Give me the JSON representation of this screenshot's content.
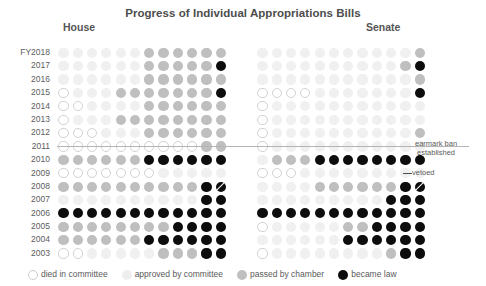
{
  "chart_data": {
    "type": "heatmap",
    "title": "Progress of Individual Appropriations Bills",
    "xlabel": "",
    "ylabel": "",
    "grid": false,
    "legend_position": "bottom-left",
    "panels": [
      {
        "key": "house",
        "label": "House"
      },
      {
        "key": "senate",
        "label": "Senate"
      }
    ],
    "columns": 12,
    "categories": [
      "FY2018",
      "2017",
      "2016",
      "2015",
      "2014",
      "2013",
      "2012",
      "2011",
      "2010",
      "2009",
      "2008",
      "2007",
      "2006",
      "2005",
      "2004",
      "2003"
    ],
    "states": [
      {
        "key": "died",
        "label": "died in committee",
        "color": "#ffffff"
      },
      {
        "key": "approved",
        "label": "approved by committee",
        "color": "#f0f0f0"
      },
      {
        "key": "passed",
        "label": "passed by chamber",
        "color": "#bfbfbf"
      },
      {
        "key": "law",
        "label": "became law",
        "color": "#0d0d0d"
      }
    ],
    "series": [
      {
        "name": "House",
        "rows": [
          {
            "year": "FY2018",
            "cells": [
              "approved",
              "approved",
              "approved",
              "approved",
              "approved",
              "approved",
              "passed",
              "passed",
              "passed",
              "passed",
              "passed",
              "passed"
            ]
          },
          {
            "year": "2017",
            "cells": [
              "approved",
              "approved",
              "approved",
              "approved",
              "approved",
              "approved",
              "passed",
              "passed",
              "passed",
              "passed",
              "passed",
              "law"
            ]
          },
          {
            "year": "2016",
            "cells": [
              "approved",
              "approved",
              "approved",
              "approved",
              "approved",
              "approved",
              "passed",
              "passed",
              "passed",
              "passed",
              "passed",
              "passed"
            ]
          },
          {
            "year": "2015",
            "cells": [
              "died",
              "approved",
              "approved",
              "approved",
              "passed",
              "passed",
              "passed",
              "passed",
              "passed",
              "passed",
              "passed",
              "law"
            ]
          },
          {
            "year": "2014",
            "cells": [
              "died",
              "died",
              "approved",
              "approved",
              "approved",
              "approved",
              "passed",
              "passed",
              "passed",
              "passed",
              "passed",
              "passed"
            ]
          },
          {
            "year": "2013",
            "cells": [
              "died",
              "approved",
              "approved",
              "approved",
              "passed",
              "passed",
              "passed",
              "passed",
              "passed",
              "passed",
              "passed",
              "passed"
            ]
          },
          {
            "year": "2012",
            "cells": [
              "died",
              "died",
              "died",
              "approved",
              "approved",
              "approved",
              "passed",
              "passed",
              "passed",
              "passed",
              "passed",
              "passed"
            ]
          },
          {
            "year": "2011",
            "cells": [
              "died",
              "died",
              "died",
              "died",
              "died",
              "died",
              "died",
              "died",
              "died",
              "died",
              "passed",
              "passed"
            ]
          },
          {
            "year": "2010",
            "cells": [
              "passed",
              "passed",
              "passed",
              "passed",
              "passed",
              "passed",
              "law",
              "law",
              "law",
              "law",
              "law",
              "law"
            ]
          },
          {
            "year": "2009",
            "cells": [
              "died",
              "died",
              "died",
              "died",
              "died",
              "died",
              "died",
              "approved",
              "approved",
              "approved",
              "approved",
              "approved"
            ]
          },
          {
            "year": "2008",
            "cells": [
              "passed",
              "passed",
              "passed",
              "passed",
              "passed",
              "passed",
              "passed",
              "passed",
              "passed",
              "passed",
              "law",
              "law-vetoed"
            ]
          },
          {
            "year": "2007",
            "cells": [
              "approved",
              "approved",
              "approved",
              "approved",
              "approved",
              "approved",
              "approved",
              "approved",
              "approved",
              "approved",
              "law",
              "law"
            ]
          },
          {
            "year": "2006",
            "cells": [
              "law",
              "law",
              "law",
              "law",
              "law",
              "law",
              "law",
              "law",
              "law",
              "law",
              "law",
              "law"
            ]
          },
          {
            "year": "2005",
            "cells": [
              "passed",
              "passed",
              "passed",
              "passed",
              "passed",
              "passed",
              "passed",
              "passed",
              "law",
              "law",
              "law",
              "law"
            ]
          },
          {
            "year": "2004",
            "cells": [
              "passed",
              "passed",
              "passed",
              "passed",
              "passed",
              "passed",
              "law",
              "law",
              "law",
              "law",
              "law",
              "law"
            ]
          },
          {
            "year": "2003",
            "cells": [
              "died",
              "died",
              "approved",
              "approved",
              "approved",
              "approved",
              "approved",
              "passed",
              "passed",
              "passed",
              "law",
              "law"
            ]
          }
        ]
      },
      {
        "name": "Senate",
        "rows": [
          {
            "year": "FY2018",
            "cells": [
              "approved",
              "approved",
              "approved",
              "approved",
              "approved",
              "approved",
              "approved",
              "approved",
              "approved",
              "approved",
              "approved",
              "passed"
            ]
          },
          {
            "year": "2017",
            "cells": [
              "approved",
              "approved",
              "approved",
              "approved",
              "approved",
              "approved",
              "approved",
              "approved",
              "approved",
              "approved",
              "passed",
              "law"
            ]
          },
          {
            "year": "2016",
            "cells": [
              "approved",
              "approved",
              "approved",
              "approved",
              "approved",
              "approved",
              "approved",
              "approved",
              "approved",
              "approved",
              "approved",
              "passed"
            ]
          },
          {
            "year": "2015",
            "cells": [
              "died",
              "died",
              "died",
              "died",
              "approved",
              "approved",
              "approved",
              "approved",
              "approved",
              "approved",
              "approved",
              "law"
            ]
          },
          {
            "year": "2014",
            "cells": [
              "died",
              "approved",
              "approved",
              "approved",
              "approved",
              "approved",
              "approved",
              "approved",
              "approved",
              "approved",
              "approved",
              "approved"
            ]
          },
          {
            "year": "2013",
            "cells": [
              "died",
              "approved",
              "approved",
              "approved",
              "approved",
              "approved",
              "approved",
              "approved",
              "approved",
              "approved",
              "approved",
              "approved"
            ]
          },
          {
            "year": "2012",
            "cells": [
              "died",
              "approved",
              "approved",
              "approved",
              "approved",
              "approved",
              "approved",
              "approved",
              "approved",
              "approved",
              "approved",
              "passed"
            ]
          },
          {
            "year": "2011",
            "cells": [
              "died",
              "approved",
              "approved",
              "approved",
              "approved",
              "approved",
              "approved",
              "approved",
              "approved",
              "approved",
              "approved",
              "approved"
            ]
          },
          {
            "year": "2010",
            "cells": [
              "approved",
              "passed",
              "passed",
              "passed",
              "law",
              "law",
              "law",
              "law",
              "law",
              "law",
              "law",
              "law"
            ]
          },
          {
            "year": "2009",
            "cells": [
              "died",
              "died",
              "died",
              "approved",
              "approved",
              "approved",
              "approved",
              "approved",
              "approved",
              "approved",
              "approved",
              "approved"
            ]
          },
          {
            "year": "2008",
            "cells": [
              "approved",
              "approved",
              "approved",
              "approved",
              "passed",
              "passed",
              "passed",
              "passed",
              "passed",
              "passed",
              "law",
              "law-vetoed"
            ]
          },
          {
            "year": "2007",
            "cells": [
              "approved",
              "approved",
              "approved",
              "approved",
              "approved",
              "approved",
              "approved",
              "approved",
              "approved",
              "law",
              "law",
              "law"
            ]
          },
          {
            "year": "2006",
            "cells": [
              "law",
              "law",
              "law",
              "law",
              "law",
              "law",
              "law",
              "law",
              "law",
              "law",
              "law",
              "law"
            ]
          },
          {
            "year": "2005",
            "cells": [
              "died",
              "approved",
              "approved",
              "approved",
              "approved",
              "approved",
              "passed",
              "passed",
              "law",
              "law",
              "law",
              "law"
            ]
          },
          {
            "year": "2004",
            "cells": [
              "approved",
              "approved",
              "approved",
              "approved",
              "approved",
              "approved",
              "law",
              "law",
              "law",
              "law",
              "law",
              "law"
            ]
          },
          {
            "year": "2003",
            "cells": [
              "died",
              "approved",
              "approved",
              "approved",
              "approved",
              "approved",
              "approved",
              "approved",
              "approved",
              "passed",
              "law",
              "law"
            ]
          }
        ]
      }
    ],
    "annotations": [
      {
        "key": "earmark-ban",
        "text": "earmark ban\nestablished",
        "line1": "earmark ban",
        "line2": "established",
        "between": [
          "2011",
          "2010"
        ]
      },
      {
        "key": "vetoed-house",
        "text": "vetoed",
        "year": "2008"
      },
      {
        "key": "vetoed-senate",
        "text": "vetoed",
        "year": "2008"
      }
    ]
  }
}
